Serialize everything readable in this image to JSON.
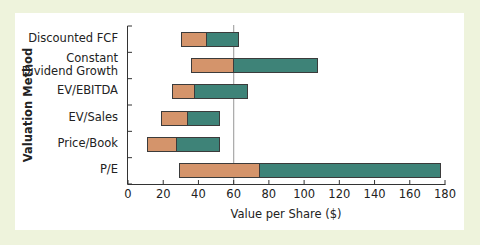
{
  "chart_data": {
    "type": "bar",
    "orientation": "horizontal",
    "stacked": "floating-range",
    "title": "",
    "xlabel": "Value per Share ($)",
    "ylabel": "Valuation Method",
    "xlim": [
      0,
      180
    ],
    "xticks": [
      0,
      20,
      40,
      60,
      80,
      100,
      120,
      140,
      160,
      180
    ],
    "reference_line": {
      "x": 60,
      "color": "#a8a8a8"
    },
    "grid": false,
    "legend": null,
    "categories": [
      "Discounted FCF",
      "Constant Dividend Growth",
      "EV/EBITDA",
      "EV/Sales",
      "Price/Book",
      "P/E"
    ],
    "series": [
      {
        "name": "low range",
        "color": "#d4946b",
        "start": [
          30,
          36,
          25,
          19,
          11,
          29
        ],
        "end": [
          45,
          60,
          38,
          34,
          28,
          75
        ]
      },
      {
        "name": "high range",
        "color": "#3e8378",
        "start": [
          45,
          60,
          38,
          34,
          28,
          75
        ],
        "end": [
          63,
          108,
          68,
          52,
          52,
          178
        ]
      }
    ],
    "ranges": [
      {
        "category": "Discounted FCF",
        "low": 30,
        "mid": 45,
        "high": 63
      },
      {
        "category": "Constant Dividend Growth",
        "low": 36,
        "mid": 60,
        "high": 108
      },
      {
        "category": "EV/EBITDA",
        "low": 25,
        "mid": 38,
        "high": 68
      },
      {
        "category": "EV/Sales",
        "low": 19,
        "mid": 34,
        "high": 52
      },
      {
        "category": "Price/Book",
        "low": 11,
        "mid": 28,
        "high": 52
      },
      {
        "category": "P/E",
        "low": 29,
        "mid": 75,
        "high": 178
      }
    ]
  },
  "labels": {
    "categories": [
      [
        "Discounted FCF"
      ],
      [
        "Constant",
        "Dividend Growth"
      ],
      [
        "EV/EBITDA"
      ],
      [
        "EV/Sales"
      ],
      [
        "Price/Book"
      ],
      [
        "P/E"
      ]
    ],
    "x_title": "Value per Share ($)",
    "y_title": "Valuation Method",
    "x_ticks": [
      "0",
      "20",
      "40",
      "60",
      "80",
      "100",
      "120",
      "140",
      "160",
      "180"
    ]
  },
  "colors": {
    "low": "#d4946b",
    "high": "#3e8378",
    "frame": "#eef3dc",
    "axis": "#333333",
    "reference": "#a8a8a8"
  }
}
